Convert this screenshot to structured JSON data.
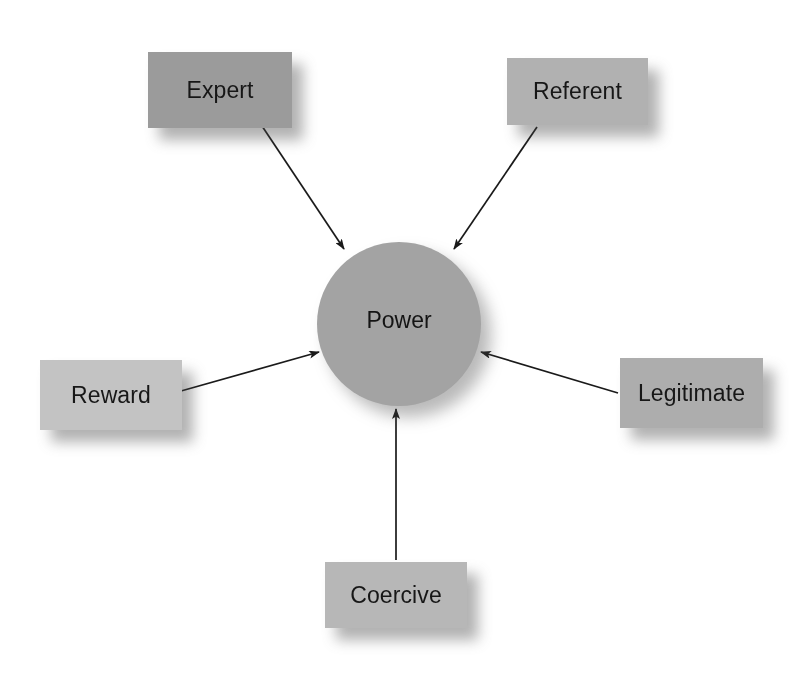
{
  "diagram": {
    "type": "hub-and-spoke",
    "title": "Power",
    "background_color": "#ffffff",
    "center": {
      "id": "power",
      "label": "Power",
      "shape": "circle",
      "fill_color": "#a3a3a3",
      "text_color": "#141414",
      "cx": 399,
      "cy": 324,
      "r": 82,
      "label_offset_y": -6
    },
    "nodes": [
      {
        "id": "expert",
        "label": "Expert",
        "shape": "rectangle",
        "fill_color": "#9b9b9b",
        "text_color": "#171717",
        "x": 148,
        "y": 52,
        "w": 144,
        "h": 76
      },
      {
        "id": "referent",
        "label": "Referent",
        "shape": "rectangle",
        "fill_color": "#b1b1b1",
        "text_color": "#171717",
        "x": 507,
        "y": 58,
        "w": 141,
        "h": 67
      },
      {
        "id": "reward",
        "label": "Reward",
        "shape": "rectangle",
        "fill_color": "#c3c3c3",
        "text_color": "#171717",
        "x": 40,
        "y": 360,
        "w": 142,
        "h": 70
      },
      {
        "id": "legitimate",
        "label": "Legitimate",
        "shape": "rectangle",
        "fill_color": "#adadad",
        "text_color": "#171717",
        "x": 620,
        "y": 358,
        "w": 143,
        "h": 70
      },
      {
        "id": "coercive",
        "label": "Coercive",
        "shape": "rectangle",
        "fill_color": "#b7b7b7",
        "text_color": "#171717",
        "x": 325,
        "y": 562,
        "w": 142,
        "h": 66
      }
    ],
    "connectors": [
      {
        "id": "expert-to-power",
        "from": "expert",
        "to": "power",
        "arrowhead": "end",
        "color": "#1a1a1a",
        "x1": 262,
        "y1": 126,
        "x2": 344,
        "y2": 249
      },
      {
        "id": "referent-to-power",
        "from": "referent",
        "to": "power",
        "arrowhead": "end",
        "color": "#1a1a1a",
        "x1": 537,
        "y1": 127,
        "x2": 454,
        "y2": 249
      },
      {
        "id": "reward-to-power",
        "from": "reward",
        "to": "power",
        "arrowhead": "end",
        "color": "#1a1a1a",
        "x1": 181,
        "y1": 391,
        "x2": 319,
        "y2": 352
      },
      {
        "id": "legitimate-to-power",
        "from": "legitimate",
        "to": "power",
        "arrowhead": "end",
        "color": "#1a1a1a",
        "x1": 618,
        "y1": 393,
        "x2": 481,
        "y2": 352
      },
      {
        "id": "coercive-to-power",
        "from": "coercive",
        "to": "power",
        "arrowhead": "end",
        "color": "#1a1a1a",
        "x1": 396,
        "y1": 560,
        "x2": 396,
        "y2": 409
      }
    ]
  }
}
